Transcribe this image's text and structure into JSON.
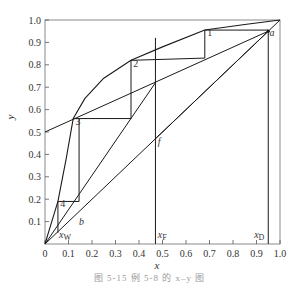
{
  "chart_data": {
    "type": "line",
    "title": "",
    "caption": "图 5-15  例 5-8 的 x–y 图",
    "xlabel": "x",
    "ylabel": "y",
    "xlim": [
      0,
      1.0
    ],
    "ylim": [
      0,
      1.0
    ],
    "grid": false,
    "x_ticks": [
      "0",
      "0.1",
      "0.2",
      "0.3",
      "0.4",
      "0.5",
      "0.6",
      "0.7",
      "0.8",
      "0.9",
      "1.0"
    ],
    "y_ticks": [
      "0.1",
      "0.2",
      "0.3",
      "0.4",
      "0.5",
      "0.6",
      "0.7",
      "0.8",
      "0.9",
      "1.0"
    ],
    "series": [
      {
        "name": "diagonal y=x",
        "x": [
          0,
          1.0
        ],
        "y": [
          0,
          1.0
        ]
      },
      {
        "name": "equilibrium curve",
        "x": [
          0,
          0.02,
          0.055,
          0.09,
          0.12,
          0.17,
          0.25,
          0.366,
          0.5,
          0.68,
          0.85,
          1.0
        ],
        "y": [
          0,
          0.07,
          0.19,
          0.38,
          0.56,
          0.65,
          0.74,
          0.82,
          0.88,
          0.955,
          0.98,
          1.0
        ]
      },
      {
        "name": "rectifying operating line",
        "x": [
          0,
          0.95
        ],
        "y": [
          0.5,
          0.95
        ]
      },
      {
        "name": "stripping operating line",
        "x": [
          0,
          0.47
        ],
        "y": [
          0,
          0.72
        ]
      },
      {
        "name": "q-line (x = xF)",
        "x": [
          0.47,
          0.47
        ],
        "y": [
          0,
          0.92
        ]
      },
      {
        "name": "feed line a–f",
        "x": [
          0.95,
          0.47
        ],
        "y": [
          0.95,
          0.47
        ]
      },
      {
        "name": "xD vertical",
        "x": [
          0.95,
          0.95
        ],
        "y": [
          0,
          0.95
        ]
      },
      {
        "name": "stages",
        "x": [
          0.95,
          0.68,
          0.68,
          0.366,
          0.366,
          0.12,
          0.12,
          0.145,
          0.145,
          0.055,
          0.055
        ],
        "y": [
          0.955,
          0.955,
          0.83,
          0.82,
          0.56,
          0.56,
          0.56,
          0.56,
          0.19,
          0.19,
          0.05
        ]
      }
    ],
    "annotations": [
      {
        "text": "1",
        "x": 0.69,
        "y": 0.93
      },
      {
        "text": "2",
        "x": 0.375,
        "y": 0.79
      },
      {
        "text": "3",
        "x": 0.13,
        "y": 0.53
      },
      {
        "text": "4",
        "x": 0.065,
        "y": 0.165
      },
      {
        "text": "a",
        "x": 0.955,
        "y": 0.93
      },
      {
        "text": "b",
        "x": 0.145,
        "y": 0.085
      },
      {
        "text": "f",
        "x": 0.48,
        "y": 0.44
      },
      {
        "text": "xW",
        "x": 0.06,
        "y": 0.025
      },
      {
        "text": "xF",
        "x": 0.48,
        "y": 0.025
      },
      {
        "text": "xD",
        "x": 0.89,
        "y": 0.025
      }
    ]
  }
}
